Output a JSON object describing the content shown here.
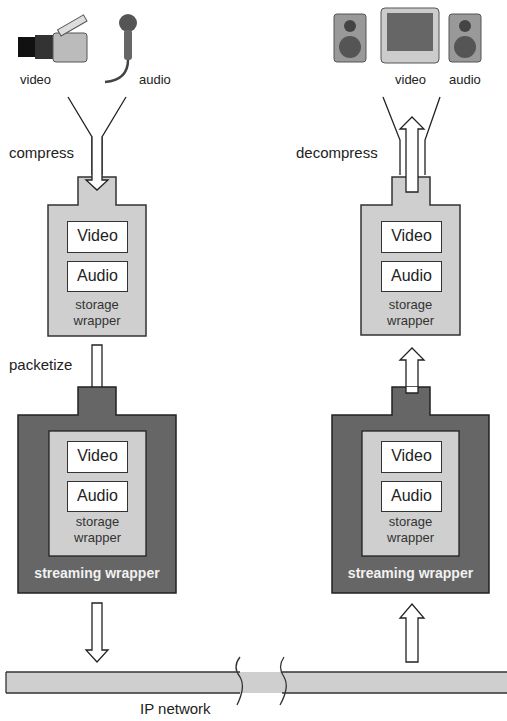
{
  "sender": {
    "sources": [
      {
        "label": "video",
        "icon": "video-camera-icon"
      },
      {
        "label": "audio",
        "icon": "microphone-icon"
      }
    ],
    "step1_label": "compress",
    "storage_wrapper": {
      "tracks": [
        "Video",
        "Audio"
      ],
      "label_line1": "storage",
      "label_line2": "wrapper"
    },
    "step2_label": "packetize",
    "streaming_wrapper": {
      "tracks": [
        "Video",
        "Audio"
      ],
      "inner_label_line1": "storage",
      "inner_label_line2": "wrapper",
      "label": "streaming wrapper"
    }
  },
  "receiver": {
    "outputs": [
      {
        "label": "video",
        "icon": "monitor-icon"
      },
      {
        "label": "audio",
        "icon": "speaker-icon"
      }
    ],
    "step1_label": "decompress",
    "storage_wrapper": {
      "tracks": [
        "Video",
        "Audio"
      ],
      "label_line1": "storage",
      "label_line2": "wrapper"
    },
    "streaming_wrapper": {
      "tracks": [
        "Video",
        "Audio"
      ],
      "inner_label_line1": "storage",
      "inner_label_line2": "wrapper",
      "label": "streaming wrapper"
    }
  },
  "network": {
    "label": "IP network"
  },
  "colors": {
    "light_gray": "#cfcfcf",
    "dark_gray": "#666666",
    "outline": "#333333"
  }
}
